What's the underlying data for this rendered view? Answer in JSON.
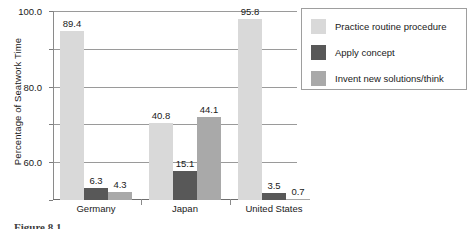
{
  "chart_data": {
    "type": "bar",
    "title": "",
    "xlabel": "",
    "ylabel": "Percentage of Seatwork Time",
    "ylim": [
      0,
      100
    ],
    "yticks": [
      "0.0",
      "20.0",
      "40.0",
      "60.0",
      "80.0",
      "100.0"
    ],
    "ytick_values": [
      0,
      20,
      40,
      60,
      80,
      100
    ],
    "grid": true,
    "legend_position": "right-top",
    "categories": [
      "Germany",
      "Japan",
      "United States"
    ],
    "series": [
      {
        "name": "Practice routine procedure",
        "color": "#d9d9d9",
        "values": [
          89.4,
          40.8,
          95.8
        ],
        "labels": [
          "89.4",
          "40.8",
          "95.8"
        ]
      },
      {
        "name": "Apply concept",
        "color": "#585858",
        "values": [
          6.3,
          15.1,
          3.5
        ],
        "labels": [
          "6.3",
          "15.1",
          "3.5"
        ]
      },
      {
        "name": "Invent new solutions/think",
        "color": "#a9a9a9",
        "values": [
          4.3,
          44.1,
          0.7
        ],
        "labels": [
          "4.3",
          "44.1",
          "0.7"
        ]
      }
    ]
  },
  "caption": {
    "text": "Figure 8.1"
  }
}
